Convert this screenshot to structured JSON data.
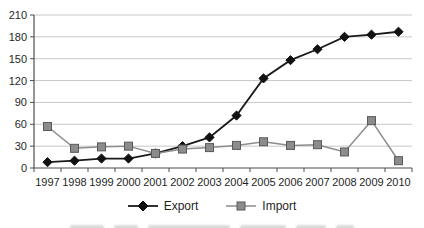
{
  "chart_data": {
    "type": "line",
    "title": "",
    "categories": [
      "1997",
      "1998",
      "1999",
      "2000",
      "2001",
      "2002",
      "2003",
      "2004",
      "2005",
      "2006",
      "2007",
      "2008",
      "2009",
      "2010"
    ],
    "series": [
      {
        "name": "Export",
        "values": [
          8,
          10,
          13,
          13,
          20,
          30,
          42,
          72,
          123,
          148,
          163,
          180,
          183,
          187
        ],
        "line_color": "#1a1a1a",
        "line_width": 1.8,
        "marker": "diamond",
        "marker_fill": "#111111",
        "marker_border": "#111111"
      },
      {
        "name": "Import",
        "values": [
          57,
          27,
          29,
          30,
          20,
          26,
          28,
          31,
          36,
          31,
          32,
          22,
          65,
          10
        ],
        "line_color": "#8c8c8c",
        "line_width": 1.5,
        "marker": "square",
        "marker_fill": "#8c8c8c",
        "marker_border": "#595959"
      }
    ],
    "xlabel": "",
    "ylabel": "",
    "ylim": [
      0,
      210
    ],
    "yticks": [
      0,
      30,
      60,
      90,
      120,
      150,
      180,
      210
    ],
    "grid": "horizontal",
    "legend_position": "bottom"
  },
  "colors": {
    "background": "#ffffff",
    "gridline": "#c8c8c8",
    "axis": "#4d4d4d",
    "text": "#1f1f1f"
  }
}
